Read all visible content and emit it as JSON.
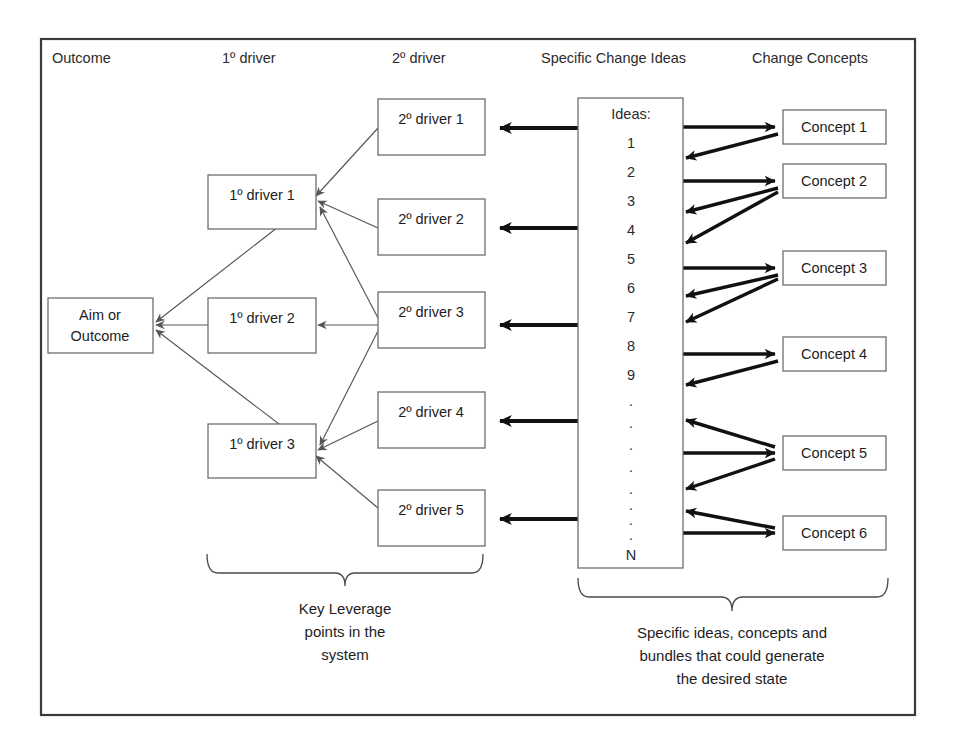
{
  "diagram": {
    "columns": [
      {
        "key": "outcome",
        "label": "Outcome"
      },
      {
        "key": "primary",
        "label": "1º driver"
      },
      {
        "key": "secondary",
        "label": "2º driver"
      },
      {
        "key": "ideas",
        "label": "Specific Change Ideas"
      },
      {
        "key": "concepts",
        "label": "Change Concepts"
      }
    ],
    "outcome_box": {
      "line1": "Aim or",
      "line2": "Outcome"
    },
    "primary_drivers": [
      {
        "label": "1º driver 1"
      },
      {
        "label": "1º driver 2"
      },
      {
        "label": "1º driver 3"
      }
    ],
    "secondary_drivers": [
      {
        "label": "2º driver 1"
      },
      {
        "label": "2º driver 2"
      },
      {
        "label": "2º driver 3"
      },
      {
        "label": "2º driver 4"
      },
      {
        "label": "2º driver 5"
      }
    ],
    "ideas_box": {
      "heading": "Ideas:",
      "items": [
        "1",
        "2",
        "3",
        "4",
        "5",
        "6",
        "7",
        "8",
        "9"
      ],
      "ellipsis": [
        "·",
        "·",
        "·",
        "·",
        "·",
        "·",
        "·",
        "·"
      ],
      "last": "N"
    },
    "concepts": [
      {
        "label": "Concept 1"
      },
      {
        "label": "Concept 2"
      },
      {
        "label": "Concept 3"
      },
      {
        "label": "Concept 4"
      },
      {
        "label": "Concept 5"
      },
      {
        "label": "Concept 6"
      }
    ],
    "captions": {
      "left": {
        "line1": "Key Leverage",
        "line2": "points in the",
        "line3": "system"
      },
      "right": {
        "line1": "Specific ideas, concepts and",
        "line2": "bundles that could generate",
        "line3": "the desired state"
      }
    },
    "colors": {
      "background": "#ffffff",
      "frame_stroke": "#3a3a3a",
      "box_stroke": "#6e6e6e",
      "text": "#1d1d1d",
      "thin_arrow": "#555555",
      "thick_arrow": "#111111",
      "brace": "#4a4a4a"
    }
  }
}
